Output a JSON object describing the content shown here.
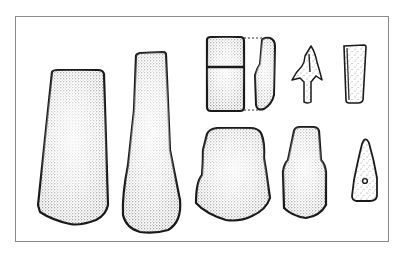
{
  "figure": {
    "frame_color": "#8a8a8a",
    "ink_color": "#1a1a1a",
    "background": "#ffffff",
    "artifacts": [
      {
        "id": "adze-large-trapezoid",
        "label": "Large trapezoidal stone adze"
      },
      {
        "id": "axe-elongated",
        "label": "Elongated waisted stone axe"
      },
      {
        "id": "adze-rectangular-with-profile",
        "label": "Small rectangular adze with side profile"
      },
      {
        "id": "arrowhead-barbed",
        "label": "Barbed tanged arrowhead"
      },
      {
        "id": "chisel-narrow",
        "label": "Narrow chisel"
      },
      {
        "id": "adze-shouldered-wide",
        "label": "Wide shouldered adze"
      },
      {
        "id": "adze-shouldered-narrow",
        "label": "Narrow shouldered adze"
      },
      {
        "id": "pendant-perforated",
        "label": "Perforated triangular pendant"
      }
    ]
  }
}
